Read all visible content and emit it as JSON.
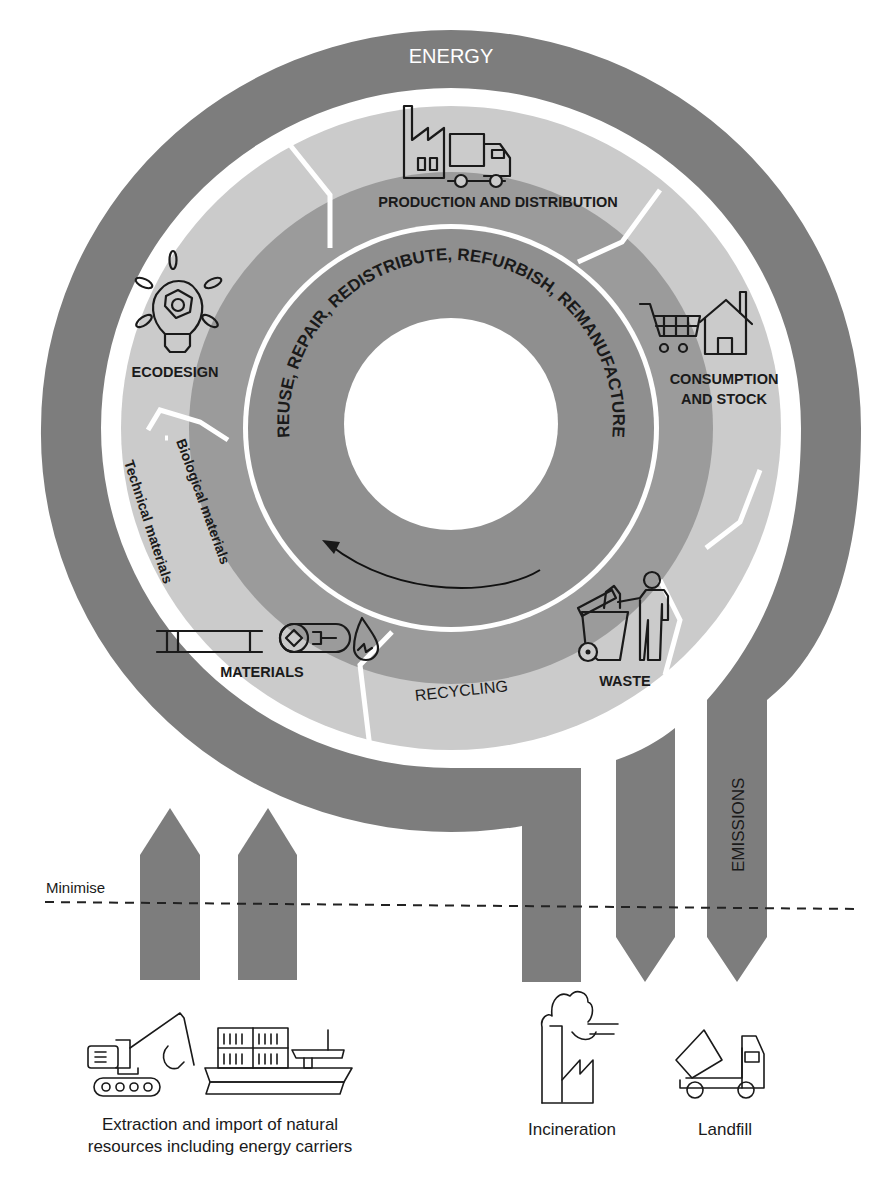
{
  "diagram": {
    "outer_ring_label": "ENERGY",
    "inner_ring_label": "REUSE, REPAIR, REDISTRIBUTE, REFURBISH, REMANUFACTURE",
    "segments": [
      {
        "id": "production",
        "label": "PRODUCTION AND DISTRIBUTION",
        "icon": "factory-truck-icon"
      },
      {
        "id": "consumption",
        "label_line1": "CONSUMPTION",
        "label_line2": "AND STOCK",
        "icon": "cart-house-icon"
      },
      {
        "id": "waste",
        "label": "WASTE",
        "icon": "bin-person-icon"
      },
      {
        "id": "recycling",
        "label": "RECYCLING"
      },
      {
        "id": "materials",
        "label": "MATERIALS",
        "icon": "materials-icon"
      },
      {
        "id": "ecodesign",
        "label": "ECODESIGN",
        "icon": "lightbulb-icon"
      }
    ],
    "material_types": {
      "biological": "Biological materials",
      "technical": "Technical materials"
    },
    "flows": {
      "emissions": "EMISSIONS",
      "minimise": "Minimise"
    },
    "bottom": {
      "extraction_line1": "Extraction and import of natural",
      "extraction_line2": "resources including energy carriers",
      "incineration": "Incineration",
      "landfill": "Landfill"
    },
    "colors": {
      "outer_ring": "#7d7d7d",
      "light_ring": "#cbcbcb",
      "mid_ring": "#9b9b9b",
      "inner_ring": "#8f8f8f"
    }
  }
}
